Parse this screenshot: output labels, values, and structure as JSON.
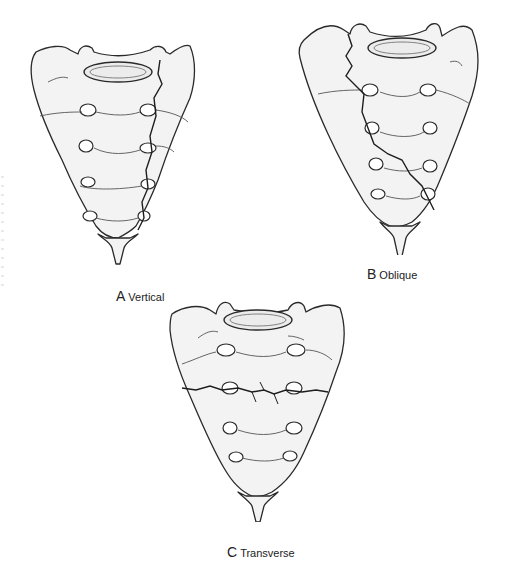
{
  "figure": {
    "panels": [
      {
        "letter": "A",
        "label": "Vertical",
        "fracture": "vertical"
      },
      {
        "letter": "B",
        "label": "Oblique",
        "fracture": "oblique"
      },
      {
        "letter": "C",
        "label": "Transverse",
        "fracture": "transverse"
      }
    ]
  },
  "colors": {
    "outline": "#2a2a2a",
    "fill": "#f3f3f3",
    "shade": "#e6e6e6",
    "background": "#ffffff"
  }
}
